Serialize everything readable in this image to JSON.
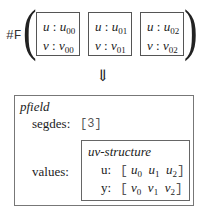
{
  "top": {
    "prefix": "#F",
    "cells": [
      {
        "row1_var": "u",
        "row1_val": "u",
        "row1_sub": "00",
        "row2_var": "v",
        "row2_val": "v",
        "row2_sub": "00"
      },
      {
        "row1_var": "u",
        "row1_val": "u",
        "row1_sub": "01",
        "row2_var": "v",
        "row2_val": "v",
        "row2_sub": "01"
      },
      {
        "row1_var": "u",
        "row1_val": "u",
        "row1_sub": "02",
        "row2_var": "v",
        "row2_val": "v",
        "row2_sub": "02"
      }
    ],
    "separator": ":"
  },
  "arrow": "⇓",
  "pfield": {
    "title": "pfield",
    "segdes_label": "segdes:",
    "segdes_value": "[3]",
    "values_label": "values:",
    "uv": {
      "title": "uv-structure",
      "u_label": "u:",
      "u_items": [
        {
          "v": "u",
          "s": "0"
        },
        {
          "v": "u",
          "s": "1"
        },
        {
          "v": "u",
          "s": "2"
        }
      ],
      "y_label": "y:",
      "y_items": [
        {
          "v": "v",
          "s": "0"
        },
        {
          "v": "v",
          "s": "1"
        },
        {
          "v": "v",
          "s": "2"
        }
      ],
      "open": "[",
      "close": "]"
    }
  }
}
